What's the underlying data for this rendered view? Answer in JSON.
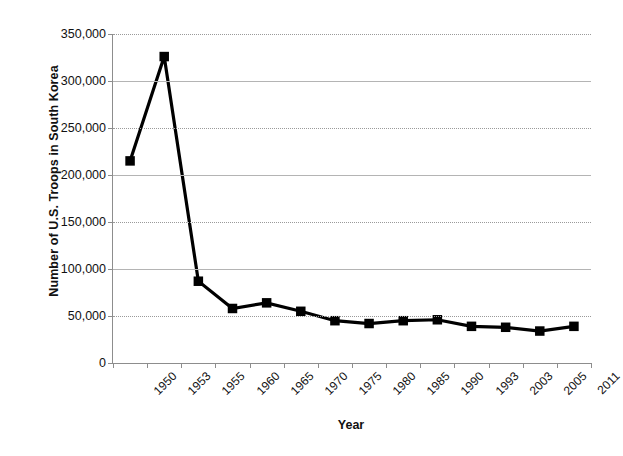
{
  "chart_data": {
    "type": "line",
    "title": "",
    "xlabel": "Year",
    "ylabel": "Number of U.S. Troops in South Korea",
    "categories": [
      "1950",
      "1953",
      "1955",
      "1960",
      "1965",
      "1970",
      "1975",
      "1980",
      "1985",
      "1990",
      "1993",
      "2003",
      "2005",
      "2011"
    ],
    "values": [
      215000,
      326000,
      87000,
      58000,
      64000,
      55000,
      45000,
      42000,
      45000,
      46000,
      39000,
      38000,
      34000,
      39000
    ],
    "series": [
      {
        "name": "U.S. Troops in South Korea",
        "values": [
          215000,
          326000,
          87000,
          58000,
          64000,
          55000,
          45000,
          42000,
          45000,
          46000,
          39000,
          38000,
          34000,
          39000
        ]
      }
    ],
    "ylim": [
      0,
      350000
    ],
    "ytick_values": [
      0,
      50000,
      100000,
      150000,
      200000,
      250000,
      300000,
      350000
    ],
    "ytick_labels": [
      "0",
      "50,000",
      "100,000",
      "150,000",
      "200,000",
      "250,000",
      "300,000",
      "350,000"
    ],
    "grid": true,
    "legend": "none",
    "marker": "square",
    "line_color": "#000000",
    "marker_color": "#000000",
    "grid_color": "#b4b4b4",
    "axis_color": "#8d8d8d"
  }
}
